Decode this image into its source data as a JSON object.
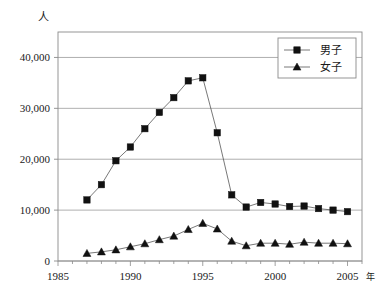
{
  "chart_data": {
    "type": "line",
    "title": "",
    "xlabel": "年",
    "ylabel": "人",
    "x": [
      1987,
      1988,
      1989,
      1990,
      1991,
      1992,
      1993,
      1994,
      1995,
      1996,
      1997,
      1998,
      1999,
      2000,
      2001,
      2002,
      2003,
      2004,
      2005
    ],
    "xlim": [
      1985,
      2006
    ],
    "ylim": [
      0,
      45000
    ],
    "xticks": [
      1985,
      1990,
      1995,
      2000,
      2005
    ],
    "xtick_labels": [
      "1985",
      "1990",
      "1995",
      "2000",
      "2005"
    ],
    "yticks": [
      0,
      10000,
      20000,
      30000,
      40000
    ],
    "ytick_labels": [
      "0",
      "10,000",
      "20,000",
      "30,000",
      "40,000"
    ],
    "grid": "horizontal",
    "legend_position": "top-right",
    "series": [
      {
        "name": "男子",
        "marker": "square",
        "values": [
          12000,
          15000,
          19700,
          22400,
          26000,
          29200,
          32100,
          35400,
          36000,
          25200,
          13000,
          10600,
          11500,
          11200,
          10700,
          10800,
          10300,
          10000,
          9700
        ]
      },
      {
        "name": "女子",
        "marker": "triangle",
        "values": [
          1500,
          1800,
          2200,
          2800,
          3400,
          4200,
          4900,
          6200,
          7400,
          6300,
          3900,
          3000,
          3500,
          3500,
          3300,
          3700,
          3500,
          3500,
          3400
        ]
      }
    ]
  },
  "legend": {
    "items": [
      {
        "label": "男子",
        "marker": "square"
      },
      {
        "label": "女子",
        "marker": "triangle"
      }
    ]
  },
  "axes": {
    "y_unit": "人",
    "x_unit": "年"
  },
  "colors": {
    "series": "#111111",
    "grid": "#9a9a9a",
    "frame": "#8a8a8a",
    "text": "#1a1a1a"
  }
}
